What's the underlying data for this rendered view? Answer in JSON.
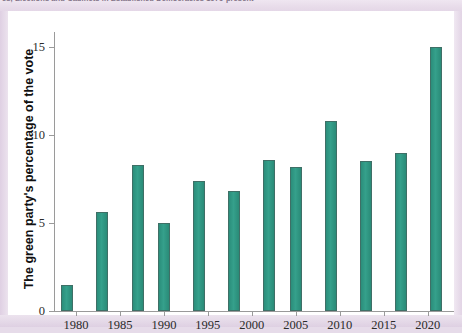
{
  "header": {
    "running_head": "cs, Elections and Cabinets in Established Democracies 1970-present"
  },
  "figure": {
    "background_color": "#ffffff",
    "page_background_color": "#e6dbe9"
  },
  "chart_data": {
    "type": "bar",
    "title": "",
    "xlabel": "",
    "ylabel": "The green party's percentage of the vote",
    "bar_color": "#2e9480",
    "grid": false,
    "legend": "none",
    "xlim": [
      1977.5,
      2023.0
    ],
    "ylim": [
      0,
      16
    ],
    "ytick_labels": [
      "0",
      "5",
      "10",
      "15"
    ],
    "ytick_values": [
      0,
      5,
      10,
      15
    ],
    "xtick_labels": [
      "1980",
      "1985",
      "1990",
      "1995",
      "2000",
      "2005",
      "2010",
      "2015",
      "2020"
    ],
    "xtick_values": [
      1980,
      1985,
      1990,
      1995,
      2000,
      2005,
      2010,
      2015,
      2020
    ],
    "x": [
      1979,
      1983,
      1987,
      1990,
      1994,
      1998,
      2002,
      2005,
      2009,
      2013,
      2017,
      2021
    ],
    "values": [
      1.5,
      5.6,
      8.3,
      5.0,
      7.4,
      6.8,
      8.6,
      8.2,
      10.8,
      8.5,
      9.0,
      15.0
    ],
    "categories": [
      "1979",
      "1983",
      "1987",
      "1990",
      "1994",
      "1998",
      "2002",
      "2005",
      "2009",
      "2013",
      "2017",
      "2021"
    ]
  }
}
